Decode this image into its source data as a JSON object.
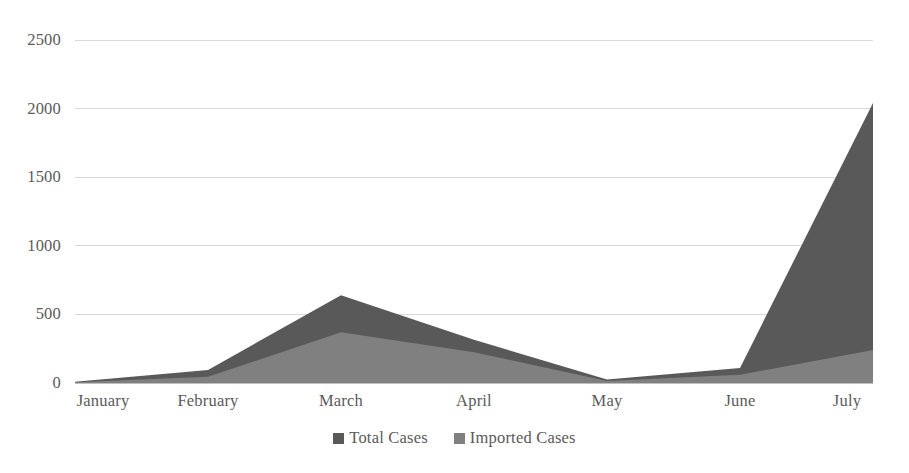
{
  "chart_data": {
    "type": "area",
    "title": "",
    "subtitle": "",
    "xlabel": "",
    "ylabel": "",
    "categories": [
      "January",
      "February",
      "March",
      "April",
      "May",
      "June",
      "July"
    ],
    "series": [
      {
        "name": "Total Cases",
        "color": "#595959",
        "values": [
          10,
          95,
          640,
          315,
          25,
          110,
          2040
        ]
      },
      {
        "name": "Imported Cases",
        "color": "#808080",
        "values": [
          5,
          45,
          370,
          225,
          15,
          60,
          240
        ]
      }
    ],
    "ylim": [
      0,
      2500
    ],
    "yticks": [
      0,
      500,
      1000,
      1500,
      2000,
      2500
    ],
    "ytick_labels": [
      "0",
      "500",
      "1000",
      "1500",
      "2000",
      "2500"
    ],
    "grid": true,
    "grid_color": "#d9d9d9",
    "axis_color": "#bfbfbf",
    "legend_position": "bottom",
    "stacked": false,
    "background": "#ffffff"
  },
  "legend": {
    "items": [
      {
        "label": "Total Cases",
        "color": "#595959"
      },
      {
        "label": "Imported Cases",
        "color": "#808080"
      }
    ]
  },
  "axes": {
    "y": {
      "labels": [
        "2500",
        "2000",
        "1500",
        "1000",
        "500",
        "0"
      ]
    },
    "x": {
      "labels": [
        "January",
        "February",
        "March",
        "April",
        "May",
        "June",
        "July"
      ]
    }
  }
}
